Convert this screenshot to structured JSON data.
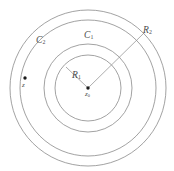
{
  "figure": {
    "name": "concentric-annulus-diagram",
    "background_color": "#ffffff",
    "stroke_color": "#8a8a8a",
    "point_color": "#1a1a1a",
    "width": 174,
    "height": 171,
    "center": {
      "x": 88,
      "y": 88
    },
    "circles": [
      {
        "id": "inner-a",
        "radius": 33,
        "label_group": "C1"
      },
      {
        "id": "inner-b",
        "radius": 44,
        "label_group": "C1"
      },
      {
        "id": "outer-a",
        "radius": 68,
        "label_group": "C2"
      },
      {
        "id": "outer-b",
        "radius": 78,
        "label_group": "C2"
      }
    ],
    "labels": {
      "circle_inner": "C",
      "circle_inner_sub": "1",
      "circle_outer": "C",
      "circle_outer_sub": "2",
      "radius_inner": "R",
      "radius_inner_sub": "1",
      "radius_outer": "R",
      "radius_outer_sub": "2",
      "center_point": "z",
      "center_point_sub": "0",
      "exterior_point": "z"
    },
    "radius_lines": [
      {
        "id": "R1",
        "from": {
          "x": 88,
          "y": 88
        },
        "to": {
          "x": 66,
          "y": 67
        }
      },
      {
        "id": "R2",
        "from": {
          "x": 88,
          "y": 88
        },
        "to": {
          "x": 144,
          "y": 33
        }
      }
    ],
    "points": [
      {
        "id": "z0",
        "x": 88,
        "y": 88,
        "r": 1.7
      },
      {
        "id": "z",
        "x": 25,
        "y": 78,
        "r": 1.7
      }
    ]
  }
}
